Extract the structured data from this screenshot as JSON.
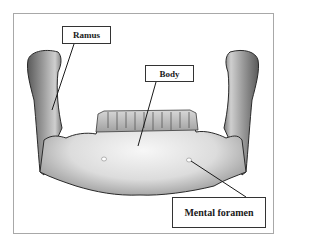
{
  "figure": {
    "labels": {
      "ramus": "Ramus",
      "body": "Body",
      "mental_foramen": "Mental foramen"
    },
    "colors": {
      "frame_border": "#a8a8a8",
      "label_border": "#333333",
      "leader_line": "#1a1a1a",
      "bone_light": "#f2f2f2",
      "bone_mid": "#bdbdbd",
      "bone_dark": "#5a5a5a"
    }
  }
}
